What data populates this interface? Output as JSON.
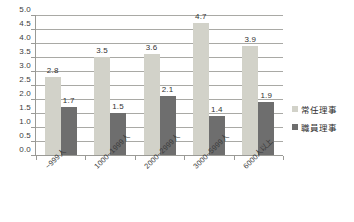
{
  "chart_data": {
    "type": "bar",
    "title": "",
    "subtitle": "",
    "xlabel": "",
    "ylabel": "",
    "categories": [
      "~999人",
      "1000~1999人",
      "2000~2999人",
      "3000~5999人",
      "6000人以上"
    ],
    "series": [
      {
        "name": "常任理事",
        "color": "#d2d2c9",
        "values": [
          2.8,
          3.5,
          3.6,
          4.7,
          3.9
        ],
        "labels": [
          "2.8",
          "3.5",
          "3.6",
          "4.7",
          "3.9"
        ]
      },
      {
        "name": "職員理事",
        "color": "#6e6e6e",
        "values": [
          1.7,
          1.5,
          2.1,
          1.4,
          1.9
        ],
        "labels": [
          "1.7",
          "1.5",
          "2.1",
          "1.4",
          "1.9"
        ]
      }
    ],
    "ylim": [
      0.0,
      5.0
    ],
    "ytick_step": 0.5,
    "ytick_labels": [
      "0.0",
      "0.5",
      "1.0",
      "1.5",
      "2.0",
      "2.5",
      "3.0",
      "3.5",
      "4.0",
      "4.5",
      "5.0"
    ],
    "grid": true,
    "grid_axis": "y",
    "grid_color": "#a9a9a5",
    "legend": true,
    "legend_position": "right",
    "data_labels": true,
    "xtick_rotation": -45,
    "axis_color": "#9a9a96",
    "background": "#ffffff"
  }
}
